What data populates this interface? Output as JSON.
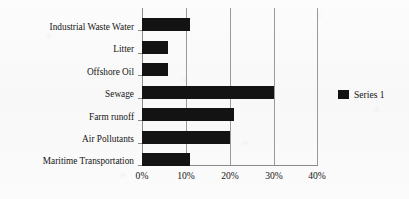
{
  "chart_data": {
    "type": "bar",
    "orientation": "horizontal",
    "title": "",
    "xlabel": "",
    "ylabel": "",
    "categories": [
      "Industrial Waste Water",
      "Litter",
      "Offshore Oil",
      "Sewage",
      "Farm runoff",
      "Air Pollutants",
      "Maritime Transportation"
    ],
    "values": [
      11,
      6,
      6,
      30,
      21,
      20,
      11
    ],
    "series": [
      {
        "name": "Series 1",
        "values": [
          11,
          6,
          6,
          30,
          21,
          20,
          11
        ],
        "color": "#131313"
      }
    ],
    "xlim": [
      0,
      40
    ],
    "xticks": [
      0,
      10,
      20,
      30,
      40
    ],
    "xtick_labels": [
      "0%",
      "10%",
      "20%",
      "30%",
      "40%"
    ],
    "grid": true,
    "grid_axis": "x",
    "legend": {
      "position": "right",
      "entries": [
        {
          "label": "Series 1",
          "color": "#131313"
        }
      ]
    },
    "colors": {
      "bar": "#131313",
      "axis": "#8a8a8a",
      "grid": "#9a9a9a",
      "text": "#151515",
      "background": "#fbfbfb"
    }
  }
}
